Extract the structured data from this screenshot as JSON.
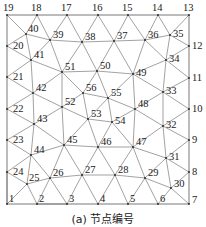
{
  "caption": "(a) 节点编号",
  "colors": {
    "edge": "#7a7a7a",
    "label": "#1a1a1a",
    "node": "#222222"
  },
  "nodes": [
    {
      "id": 1,
      "x": 7,
      "y": 204,
      "lx": 2,
      "ly": -2
    },
    {
      "id": 2,
      "x": 37,
      "y": 204,
      "lx": 2,
      "ly": -2
    },
    {
      "id": 3,
      "x": 67,
      "y": 204,
      "lx": 2,
      "ly": -2
    },
    {
      "id": 4,
      "x": 98,
      "y": 204,
      "lx": 2,
      "ly": -2
    },
    {
      "id": 5,
      "x": 128,
      "y": 204,
      "lx": 2,
      "ly": -2
    },
    {
      "id": 6,
      "x": 158,
      "y": 204,
      "lx": 2,
      "ly": -2
    },
    {
      "id": 7,
      "x": 189,
      "y": 204,
      "lx": 3,
      "ly": -1
    },
    {
      "id": 8,
      "x": 189,
      "y": 172,
      "lx": 3,
      "ly": 3
    },
    {
      "id": 9,
      "x": 189,
      "y": 140,
      "lx": 3,
      "ly": 3
    },
    {
      "id": 10,
      "x": 189,
      "y": 109,
      "lx": 3,
      "ly": 3
    },
    {
      "id": 11,
      "x": 189,
      "y": 78,
      "lx": 3,
      "ly": 3
    },
    {
      "id": 12,
      "x": 189,
      "y": 46,
      "lx": 3,
      "ly": 3
    },
    {
      "id": 13,
      "x": 189,
      "y": 15,
      "lx": -6,
      "ly": -4
    },
    {
      "id": 14,
      "x": 158,
      "y": 15,
      "lx": -6,
      "ly": -4
    },
    {
      "id": 15,
      "x": 128,
      "y": 15,
      "lx": -6,
      "ly": -4
    },
    {
      "id": 16,
      "x": 98,
      "y": 15,
      "lx": -6,
      "ly": -4
    },
    {
      "id": 17,
      "x": 67,
      "y": 15,
      "lx": -6,
      "ly": -4
    },
    {
      "id": 18,
      "x": 37,
      "y": 15,
      "lx": -6,
      "ly": -4
    },
    {
      "id": 19,
      "x": 7,
      "y": 15,
      "lx": -4,
      "ly": -4
    },
    {
      "id": 20,
      "x": 7,
      "y": 46,
      "lx": 6,
      "ly": 3
    },
    {
      "id": 21,
      "x": 7,
      "y": 77,
      "lx": 6,
      "ly": 3
    },
    {
      "id": 22,
      "x": 7,
      "y": 109,
      "lx": 6,
      "ly": 3
    },
    {
      "id": 23,
      "x": 7,
      "y": 140,
      "lx": 6,
      "ly": 3
    },
    {
      "id": 24,
      "x": 7,
      "y": 172,
      "lx": 6,
      "ly": 3
    },
    {
      "id": 25,
      "x": 27,
      "y": 184,
      "lx": 2,
      "ly": -3
    },
    {
      "id": 26,
      "x": 50,
      "y": 178,
      "lx": 3,
      "ly": -2
    },
    {
      "id": 27,
      "x": 82,
      "y": 175,
      "lx": 3,
      "ly": -2
    },
    {
      "id": 28,
      "x": 115,
      "y": 175,
      "lx": 3,
      "ly": -2
    },
    {
      "id": 29,
      "x": 145,
      "y": 178,
      "lx": 3,
      "ly": -2
    },
    {
      "id": 30,
      "x": 171,
      "y": 188,
      "lx": 3,
      "ly": -1
    },
    {
      "id": 31,
      "x": 166,
      "y": 158,
      "lx": 3,
      "ly": 2
    },
    {
      "id": 32,
      "x": 163,
      "y": 126,
      "lx": 3,
      "ly": 2
    },
    {
      "id": 33,
      "x": 163,
      "y": 92,
      "lx": 3,
      "ly": 2
    },
    {
      "id": 34,
      "x": 166,
      "y": 60,
      "lx": 3,
      "ly": 2
    },
    {
      "id": 35,
      "x": 170,
      "y": 35,
      "lx": 3,
      "ly": 2
    },
    {
      "id": 36,
      "x": 145,
      "y": 40,
      "lx": 3,
      "ly": -2
    },
    {
      "id": 37,
      "x": 114,
      "y": 41,
      "lx": 3,
      "ly": -2
    },
    {
      "id": 38,
      "x": 82,
      "y": 42,
      "lx": 3,
      "ly": -2
    },
    {
      "id": 39,
      "x": 50,
      "y": 40,
      "lx": 3,
      "ly": -2
    },
    {
      "id": 40,
      "x": 26,
      "y": 34,
      "lx": 2,
      "ly": -2
    },
    {
      "id": 41,
      "x": 31,
      "y": 60,
      "lx": 3,
      "ly": -2
    },
    {
      "id": 42,
      "x": 33,
      "y": 93,
      "lx": 3,
      "ly": -2
    },
    {
      "id": 43,
      "x": 34,
      "y": 124,
      "lx": 3,
      "ly": -2
    },
    {
      "id": 44,
      "x": 31,
      "y": 155,
      "lx": 3,
      "ly": -2
    },
    {
      "id": 45,
      "x": 64,
      "y": 145,
      "lx": 3,
      "ly": -2
    },
    {
      "id": 46,
      "x": 98,
      "y": 147,
      "lx": 3,
      "ly": -2
    },
    {
      "id": 47,
      "x": 133,
      "y": 147,
      "lx": 3,
      "ly": -2
    },
    {
      "id": 48,
      "x": 135,
      "y": 109,
      "lx": 3,
      "ly": -2
    },
    {
      "id": 49,
      "x": 133,
      "y": 74,
      "lx": 3,
      "ly": 2
    },
    {
      "id": 50,
      "x": 97,
      "y": 71,
      "lx": 3,
      "ly": -2
    },
    {
      "id": 51,
      "x": 62,
      "y": 72,
      "lx": 3,
      "ly": -2
    },
    {
      "id": 52,
      "x": 62,
      "y": 107,
      "lx": 3,
      "ly": -2
    },
    {
      "id": 53,
      "x": 88,
      "y": 119,
      "lx": 3,
      "ly": -2
    },
    {
      "id": 54,
      "x": 112,
      "y": 122,
      "lx": 3,
      "ly": 2
    },
    {
      "id": 55,
      "x": 108,
      "y": 98,
      "lx": 3,
      "ly": -2
    },
    {
      "id": 56,
      "x": 83,
      "y": 93,
      "lx": 3,
      "ly": -2
    }
  ],
  "boundary": [
    1,
    2,
    3,
    4,
    5,
    6,
    7,
    8,
    9,
    10,
    11,
    12,
    13,
    14,
    15,
    16,
    17,
    18,
    19,
    20,
    21,
    22,
    23,
    24,
    1
  ],
  "edges": [
    [
      1,
      25
    ],
    [
      25,
      2
    ],
    [
      1,
      24
    ],
    [
      24,
      25
    ],
    [
      25,
      26
    ],
    [
      26,
      2
    ],
    [
      2,
      3
    ],
    [
      26,
      3
    ],
    [
      26,
      27
    ],
    [
      27,
      3
    ],
    [
      27,
      4
    ],
    [
      27,
      28
    ],
    [
      28,
      4
    ],
    [
      28,
      5
    ],
    [
      28,
      29
    ],
    [
      29,
      5
    ],
    [
      29,
      6
    ],
    [
      29,
      30
    ],
    [
      30,
      6
    ],
    [
      30,
      7
    ],
    [
      30,
      8
    ],
    [
      29,
      31
    ],
    [
      31,
      8
    ],
    [
      30,
      31
    ],
    [
      31,
      9
    ],
    [
      31,
      32
    ],
    [
      32,
      9
    ],
    [
      32,
      10
    ],
    [
      32,
      33
    ],
    [
      33,
      10
    ],
    [
      33,
      11
    ],
    [
      33,
      34
    ],
    [
      34,
      11
    ],
    [
      34,
      12
    ],
    [
      34,
      35
    ],
    [
      35,
      12
    ],
    [
      35,
      13
    ],
    [
      35,
      14
    ],
    [
      35,
      36
    ],
    [
      36,
      14
    ],
    [
      36,
      34
    ],
    [
      36,
      15
    ],
    [
      36,
      37
    ],
    [
      37,
      15
    ],
    [
      37,
      16
    ],
    [
      37,
      38
    ],
    [
      38,
      16
    ],
    [
      38,
      17
    ],
    [
      38,
      39
    ],
    [
      39,
      17
    ],
    [
      39,
      18
    ],
    [
      39,
      40
    ],
    [
      40,
      18
    ],
    [
      40,
      19
    ],
    [
      40,
      20
    ],
    [
      40,
      41
    ],
    [
      39,
      41
    ],
    [
      20,
      41
    ],
    [
      41,
      21
    ],
    [
      41,
      42
    ],
    [
      42,
      21
    ],
    [
      42,
      22
    ],
    [
      42,
      43
    ],
    [
      43,
      22
    ],
    [
      43,
      23
    ],
    [
      43,
      44
    ],
    [
      44,
      23
    ],
    [
      44,
      24
    ],
    [
      44,
      25
    ],
    [
      44,
      26
    ],
    [
      44,
      45
    ],
    [
      45,
      26
    ],
    [
      45,
      27
    ],
    [
      45,
      46
    ],
    [
      46,
      27
    ],
    [
      46,
      28
    ],
    [
      46,
      47
    ],
    [
      47,
      28
    ],
    [
      47,
      29
    ],
    [
      47,
      31
    ],
    [
      47,
      32
    ],
    [
      47,
      48
    ],
    [
      48,
      32
    ],
    [
      48,
      33
    ],
    [
      48,
      49
    ],
    [
      49,
      33
    ],
    [
      49,
      34
    ],
    [
      49,
      36
    ],
    [
      49,
      37
    ],
    [
      49,
      50
    ],
    [
      50,
      37
    ],
    [
      50,
      38
    ],
    [
      50,
      51
    ],
    [
      51,
      38
    ],
    [
      51,
      39
    ],
    [
      51,
      41
    ],
    [
      51,
      42
    ],
    [
      51,
      52
    ],
    [
      52,
      42
    ],
    [
      52,
      43
    ],
    [
      52,
      45
    ],
    [
      43,
      45
    ],
    [
      51,
      56
    ],
    [
      50,
      56
    ],
    [
      50,
      55
    ],
    [
      49,
      55
    ],
    [
      56,
      55
    ],
    [
      56,
      52
    ],
    [
      56,
      53
    ],
    [
      52,
      53
    ],
    [
      53,
      45
    ],
    [
      53,
      46
    ],
    [
      53,
      54
    ],
    [
      54,
      46
    ],
    [
      54,
      47
    ],
    [
      54,
      48
    ],
    [
      55,
      48
    ],
    [
      55,
      54
    ],
    [
      53,
      55
    ]
  ]
}
